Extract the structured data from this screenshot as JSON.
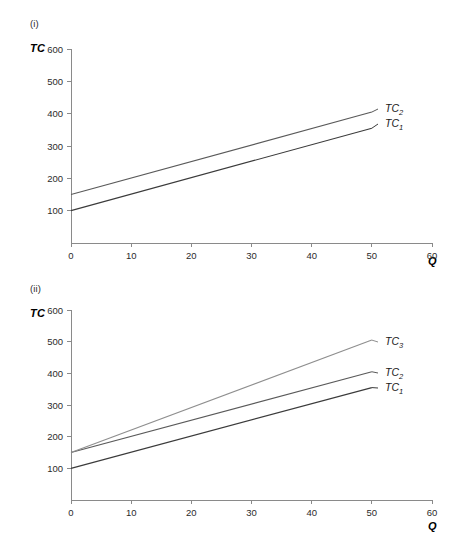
{
  "figure": {
    "background": "#ffffff",
    "panels": [
      {
        "id": "i",
        "label": "(i)",
        "y_axis_name": "TC",
        "x_axis_name": "Q"
      },
      {
        "id": "ii",
        "label": "(ii)",
        "y_axis_name": "TC",
        "x_axis_name": "Q"
      }
    ]
  },
  "chart_data": [
    {
      "type": "line",
      "panel": "(i)",
      "title": "",
      "xlabel": "Q",
      "ylabel": "TC",
      "xlim": [
        0,
        60
      ],
      "ylim": [
        0,
        600
      ],
      "xticks": [
        0,
        10,
        20,
        30,
        40,
        50,
        60
      ],
      "yticks": [
        100,
        200,
        300,
        400,
        500,
        600
      ],
      "xtick_labels": [
        "0",
        "10",
        "20",
        "30",
        "40",
        "50",
        "60"
      ],
      "ytick_labels": [
        "100",
        "200",
        "300",
        "400",
        "500",
        "600"
      ],
      "grid": false,
      "legend": "inline-right-end-labels",
      "series": [
        {
          "name": "TC_1",
          "label_base": "TC",
          "label_sub": "1",
          "color": "#3b3b3b",
          "x": [
            0,
            50
          ],
          "values": [
            100,
            355
          ],
          "intercept": 100,
          "slope": 5.1
        },
        {
          "name": "TC_2",
          "label_base": "TC",
          "label_sub": "2",
          "color": "#5a5a5a",
          "x": [
            0,
            50
          ],
          "values": [
            150,
            405
          ],
          "intercept": 150,
          "slope": 5.1
        }
      ]
    },
    {
      "type": "line",
      "panel": "(ii)",
      "title": "",
      "xlabel": "Q",
      "ylabel": "TC",
      "xlim": [
        0,
        60
      ],
      "ylim": [
        0,
        600
      ],
      "xticks": [
        0,
        10,
        20,
        30,
        40,
        50,
        60
      ],
      "yticks": [
        100,
        200,
        300,
        400,
        500,
        600
      ],
      "xtick_labels": [
        "0",
        "10",
        "20",
        "30",
        "40",
        "50",
        "60"
      ],
      "ytick_labels": [
        "100",
        "200",
        "300",
        "400",
        "500",
        "600"
      ],
      "grid": false,
      "legend": "inline-right-end-labels",
      "series": [
        {
          "name": "TC_1",
          "label_base": "TC",
          "label_sub": "1",
          "color": "#3b3b3b",
          "x": [
            0,
            50
          ],
          "values": [
            100,
            355
          ],
          "intercept": 100,
          "slope": 5.1
        },
        {
          "name": "TC_2",
          "label_base": "TC",
          "label_sub": "2",
          "color": "#5a5a5a",
          "x": [
            0,
            50
          ],
          "values": [
            150,
            405
          ],
          "intercept": 150,
          "slope": 5.1
        },
        {
          "name": "TC_3",
          "label_base": "TC",
          "label_sub": "3",
          "color": "#8f8f8f",
          "x": [
            0,
            50
          ],
          "values": [
            150,
            505
          ],
          "intercept": 150,
          "slope": 7.1
        }
      ]
    }
  ]
}
